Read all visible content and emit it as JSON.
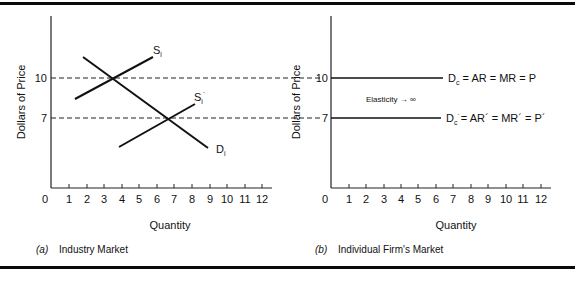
{
  "figure": {
    "panels": [
      {
        "id": "a",
        "caption_letter": "(a)",
        "caption_text": "Industry Market",
        "ylabel": "Dollars of Price",
        "xlabel": "Quantity",
        "x_ticks": [
          "0",
          "1",
          "2",
          "3",
          "4",
          "5",
          "6",
          "7",
          "8",
          "9",
          "10",
          "11",
          "12"
        ],
        "y_ticks": [
          "10",
          "7"
        ],
        "curves": [
          {
            "name": "S_i",
            "label": "S",
            "sub": "i",
            "prime": false
          },
          {
            "name": "S_i_prime",
            "label": "S",
            "sub": "i",
            "prime": true
          },
          {
            "name": "D_i",
            "label": "D",
            "sub": "i",
            "prime": false
          }
        ]
      },
      {
        "id": "b",
        "caption_letter": "(b)",
        "caption_text": "Individual Firm's Market",
        "ylabel": "Dollars of Price",
        "xlabel": "Quantity",
        "x_ticks": [
          "0",
          "1",
          "2",
          "3",
          "4",
          "5",
          "6",
          "7",
          "8",
          "9",
          "10",
          "11",
          "12"
        ],
        "y_ticks": [
          "10",
          "7"
        ],
        "annotation": "Elasticity → ∞",
        "curves": [
          {
            "name": "D_c",
            "label": "D",
            "sub": "c",
            "rest": " = AR = MR = P"
          },
          {
            "name": "D_c_prime",
            "label": "D",
            "sub": "c",
            "prime": true,
            "rest": "= AR´ = MR´ = P´"
          }
        ]
      }
    ]
  },
  "chart_data": [
    {
      "type": "line",
      "title": "(a) Industry Market",
      "xlabel": "Quantity",
      "ylabel": "Dollars of Price",
      "xlim": [
        0,
        12
      ],
      "x_ticks": [
        0,
        1,
        2,
        3,
        4,
        5,
        6,
        7,
        8,
        9,
        10,
        11,
        12
      ],
      "y_ticks": [
        7,
        10
      ],
      "grid": false,
      "reference_lines": [
        {
          "y": 10,
          "style": "dashed"
        },
        {
          "y": 7,
          "style": "dashed"
        }
      ],
      "series": [
        {
          "name": "Si",
          "points": [
            [
              1.4,
              8.8
            ],
            [
              5.8,
              11.2
            ]
          ]
        },
        {
          "name": "Si′",
          "points": [
            [
              3.9,
              5.2
            ],
            [
              8.2,
              7.7
            ]
          ]
        },
        {
          "name": "Di",
          "points": [
            [
              1.8,
              11.2
            ],
            [
              9.0,
              5.7
            ]
          ]
        }
      ],
      "equilibria": [
        {
          "quantity": 3.5,
          "price": 10
        },
        {
          "quantity": 6.6,
          "price": 7
        }
      ]
    },
    {
      "type": "line",
      "title": "(b) Individual Firm's Market",
      "xlabel": "Quantity",
      "ylabel": "Dollars of Price",
      "xlim": [
        0,
        12
      ],
      "x_ticks": [
        0,
        1,
        2,
        3,
        4,
        5,
        6,
        7,
        8,
        9,
        10,
        11,
        12
      ],
      "y_ticks": [
        7,
        10
      ],
      "grid": false,
      "series": [
        {
          "name": "Dc = AR = MR = P",
          "points": [
            [
              0,
              10
            ],
            [
              6.3,
              10
            ]
          ]
        },
        {
          "name": "Dc′ = AR′ = MR′ = P′",
          "points": [
            [
              0,
              7
            ],
            [
              6.3,
              7
            ]
          ]
        }
      ],
      "annotations": [
        "Elasticity → ∞"
      ]
    }
  ]
}
